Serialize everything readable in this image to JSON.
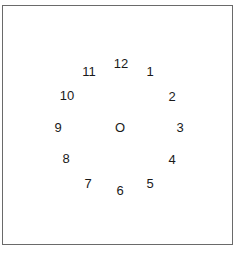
{
  "diagram": {
    "center_label": "O",
    "numbers": [
      {
        "label": "12",
        "x": 121,
        "y": 63
      },
      {
        "label": "1",
        "x": 150,
        "y": 71
      },
      {
        "label": "2",
        "x": 172,
        "y": 96
      },
      {
        "label": "3",
        "x": 180,
        "y": 127
      },
      {
        "label": "4",
        "x": 172,
        "y": 159
      },
      {
        "label": "5",
        "x": 150,
        "y": 183
      },
      {
        "label": "6",
        "x": 120,
        "y": 190
      },
      {
        "label": "7",
        "x": 88,
        "y": 183
      },
      {
        "label": "8",
        "x": 66,
        "y": 158
      },
      {
        "label": "9",
        "x": 58,
        "y": 127
      },
      {
        "label": "10",
        "x": 67,
        "y": 95
      },
      {
        "label": "11",
        "x": 89,
        "y": 71
      }
    ],
    "center": {
      "x": 120,
      "y": 127
    }
  }
}
